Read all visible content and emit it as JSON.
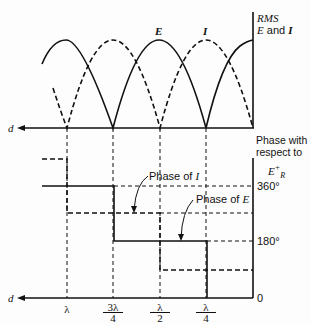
{
  "figure": {
    "top_axis_label_line1": "RMS",
    "top_axis_label_line2_var1": "E",
    "top_axis_label_line2_and": " and ",
    "top_axis_label_line2_var2": "I",
    "curve_label_E": "E",
    "curve_label_I": "I",
    "x_axis_label": "d",
    "bottom_axis_label_line1": "Phase with",
    "bottom_axis_label_line2": "respect to",
    "bottom_axis_label_ref": "E",
    "bottom_axis_label_ref_sup": "+",
    "bottom_axis_label_ref_sub": "R",
    "phase_I_label": "Phase of ",
    "phase_I_var": "I",
    "phase_E_label": "Phase of ",
    "phase_E_var": "E",
    "tick_360": "360°",
    "tick_180": "180°",
    "tick_0": "0",
    "x_ticks": [
      {
        "num": "λ",
        "den": ""
      },
      {
        "num": "3λ",
        "den": "4"
      },
      {
        "num": "λ",
        "den": "2"
      },
      {
        "num": "λ",
        "den": "4"
      }
    ]
  }
}
